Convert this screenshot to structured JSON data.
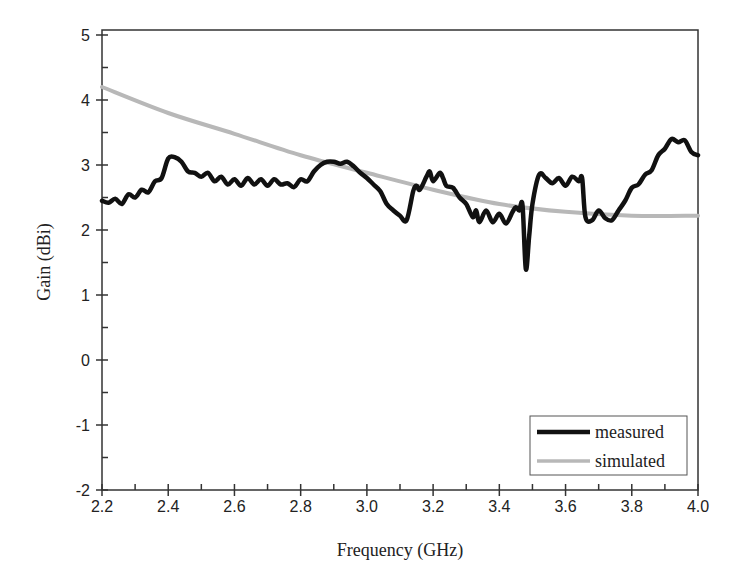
{
  "chart_data": {
    "type": "line",
    "title": "",
    "xlabel": "Frequency (GHz)",
    "ylabel": "Gain (dBi)",
    "xlim": [
      2.2,
      4.0
    ],
    "ylim": [
      -2,
      5
    ],
    "xticks": [
      "2.2",
      "2.4",
      "2.6",
      "2.8",
      "3.0",
      "3.2",
      "3.4",
      "3.6",
      "3.8",
      "4.0"
    ],
    "yticks": [
      "-2",
      "-1",
      "0",
      "1",
      "2",
      "3",
      "4",
      "5"
    ],
    "grid": false,
    "legend_position": "lower right",
    "series": [
      {
        "name": "measured",
        "color": "#111111",
        "x": [
          2.2,
          2.22,
          2.24,
          2.26,
          2.28,
          2.3,
          2.32,
          2.34,
          2.36,
          2.38,
          2.4,
          2.42,
          2.44,
          2.46,
          2.48,
          2.5,
          2.52,
          2.54,
          2.56,
          2.58,
          2.6,
          2.62,
          2.64,
          2.66,
          2.68,
          2.7,
          2.72,
          2.74,
          2.76,
          2.78,
          2.8,
          2.82,
          2.84,
          2.86,
          2.88,
          2.9,
          2.92,
          2.94,
          2.96,
          2.98,
          3.0,
          3.02,
          3.04,
          3.06,
          3.08,
          3.1,
          3.12,
          3.14,
          3.15,
          3.16,
          3.18,
          3.19,
          3.2,
          3.22,
          3.23,
          3.24,
          3.26,
          3.28,
          3.3,
          3.32,
          3.33,
          3.34,
          3.36,
          3.38,
          3.4,
          3.42,
          3.44,
          3.45,
          3.46,
          3.47,
          3.48,
          3.49,
          3.5,
          3.52,
          3.54,
          3.56,
          3.58,
          3.6,
          3.62,
          3.64,
          3.65,
          3.66,
          3.68,
          3.7,
          3.72,
          3.74,
          3.76,
          3.78,
          3.8,
          3.82,
          3.84,
          3.86,
          3.88,
          3.9,
          3.92,
          3.94,
          3.96,
          3.98,
          4.0
        ],
        "values": [
          2.45,
          2.42,
          2.48,
          2.4,
          2.55,
          2.5,
          2.62,
          2.58,
          2.75,
          2.8,
          3.1,
          3.12,
          3.05,
          2.9,
          2.88,
          2.82,
          2.88,
          2.75,
          2.82,
          2.7,
          2.78,
          2.68,
          2.8,
          2.7,
          2.78,
          2.68,
          2.78,
          2.7,
          2.72,
          2.66,
          2.78,
          2.75,
          2.9,
          3.0,
          3.05,
          3.05,
          3.02,
          3.05,
          2.98,
          2.88,
          2.8,
          2.7,
          2.6,
          2.4,
          2.3,
          2.22,
          2.15,
          2.6,
          2.68,
          2.62,
          2.82,
          2.9,
          2.75,
          2.88,
          2.8,
          2.68,
          2.65,
          2.5,
          2.4,
          2.2,
          2.3,
          2.12,
          2.3,
          2.12,
          2.25,
          2.1,
          2.28,
          2.35,
          2.3,
          2.38,
          1.4,
          1.9,
          2.4,
          2.85,
          2.8,
          2.72,
          2.8,
          2.68,
          2.82,
          2.75,
          2.8,
          2.2,
          2.15,
          2.3,
          2.18,
          2.15,
          2.3,
          2.45,
          2.65,
          2.7,
          2.85,
          2.92,
          3.15,
          3.25,
          3.4,
          3.35,
          3.38,
          3.2,
          3.15
        ]
      },
      {
        "name": "simulated",
        "color": "#b8b8b8",
        "x": [
          2.2,
          2.4,
          2.6,
          2.8,
          3.0,
          3.2,
          3.4,
          3.6,
          3.8,
          4.0
        ],
        "values": [
          4.2,
          3.8,
          3.48,
          3.15,
          2.88,
          2.62,
          2.4,
          2.28,
          2.22,
          2.22
        ]
      }
    ]
  }
}
